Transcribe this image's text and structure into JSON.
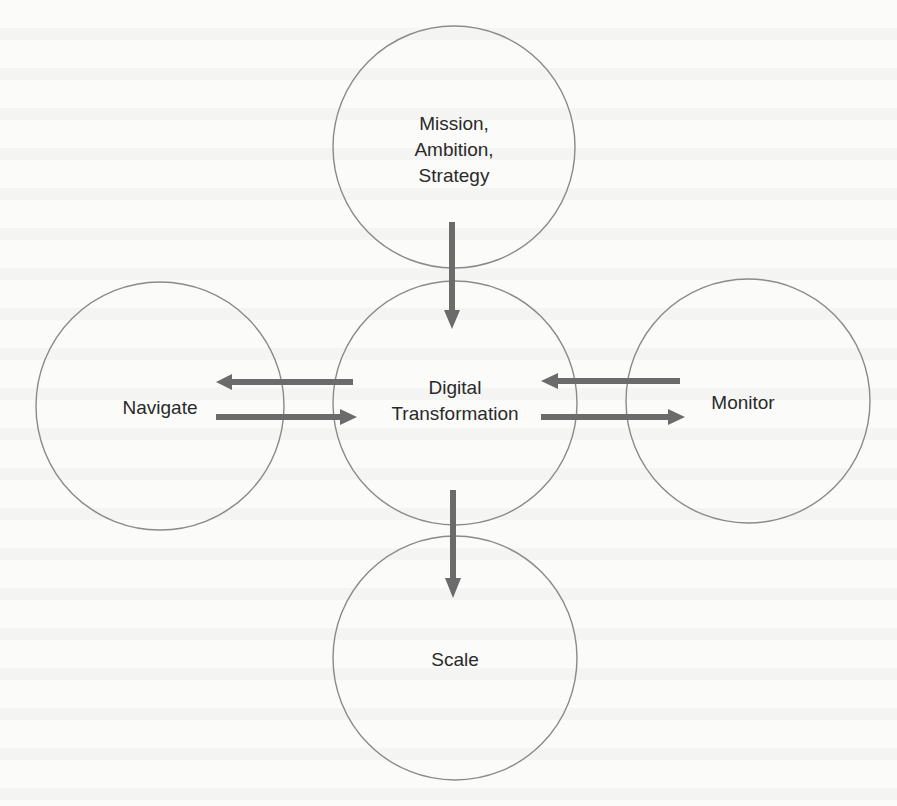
{
  "diagram": {
    "title": "",
    "colors": {
      "circle_stroke": "#8a8a8a",
      "arrow_fill": "#6b6b6b",
      "text": "#2a2a2a",
      "background": "#fbfbfa"
    },
    "nodes": [
      {
        "id": "mission",
        "label": "Mission,\nAmbition,\nStrategy",
        "cx": 454,
        "cy": 147,
        "r": 121
      },
      {
        "id": "digital",
        "label": "Digital\nTransformation",
        "cx": 455,
        "cy": 403,
        "r": 122
      },
      {
        "id": "navigate",
        "label": "Navigate",
        "cx": 160,
        "cy": 406,
        "r": 124
      },
      {
        "id": "monitor",
        "label": "Monitor",
        "cx": 748,
        "cy": 401,
        "r": 122
      },
      {
        "id": "scale",
        "label": "Scale",
        "cx": 455,
        "cy": 658,
        "r": 122
      }
    ],
    "edges": [
      {
        "from": "mission",
        "to": "digital",
        "direction": "down"
      },
      {
        "from": "digital",
        "to": "navigate",
        "direction": "left"
      },
      {
        "from": "navigate",
        "to": "digital",
        "direction": "right"
      },
      {
        "from": "monitor",
        "to": "digital",
        "direction": "left"
      },
      {
        "from": "digital",
        "to": "monitor",
        "direction": "right"
      },
      {
        "from": "digital",
        "to": "scale",
        "direction": "down"
      }
    ]
  }
}
